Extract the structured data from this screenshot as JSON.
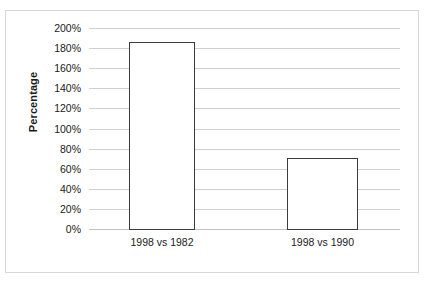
{
  "chart_data": {
    "type": "bar",
    "title": "",
    "xlabel": "",
    "ylabel": "Percentage",
    "categories": [
      "1998 vs 1982",
      "1998 vs 1990"
    ],
    "values": [
      186,
      71
    ],
    "value_labels": [
      "186%",
      "71%"
    ],
    "ylim": [
      0,
      200
    ],
    "ytick_values": [
      0,
      20,
      40,
      60,
      80,
      100,
      120,
      140,
      160,
      180,
      200
    ],
    "ytick_labels": [
      "0%",
      "20%",
      "40%",
      "60%",
      "80%",
      "100%",
      "120%",
      "140%",
      "160%",
      "180%",
      "200%"
    ],
    "grid": true,
    "grid_axis": "y",
    "legend": false,
    "legend_position": "none",
    "bar_fill_color": "#ffffff",
    "bar_edge_color": "#3b3b3b",
    "gridline_color": "#d0d0d0",
    "frame_color": "#d7d7d7",
    "text_color": "#1a1a1a",
    "background_color": "#ffffff"
  }
}
